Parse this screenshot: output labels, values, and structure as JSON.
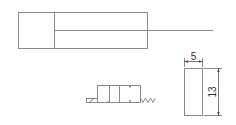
{
  "drawing": {
    "cylinder": {
      "label": "cylinder-body"
    },
    "valve": {
      "label": "solenoid-valve-symbol"
    },
    "part": {
      "width_dimension": "5",
      "height_dimension": "13"
    }
  },
  "colors": {
    "line": "#8a8a8a",
    "text": "#333333",
    "background": "#ffffff"
  }
}
